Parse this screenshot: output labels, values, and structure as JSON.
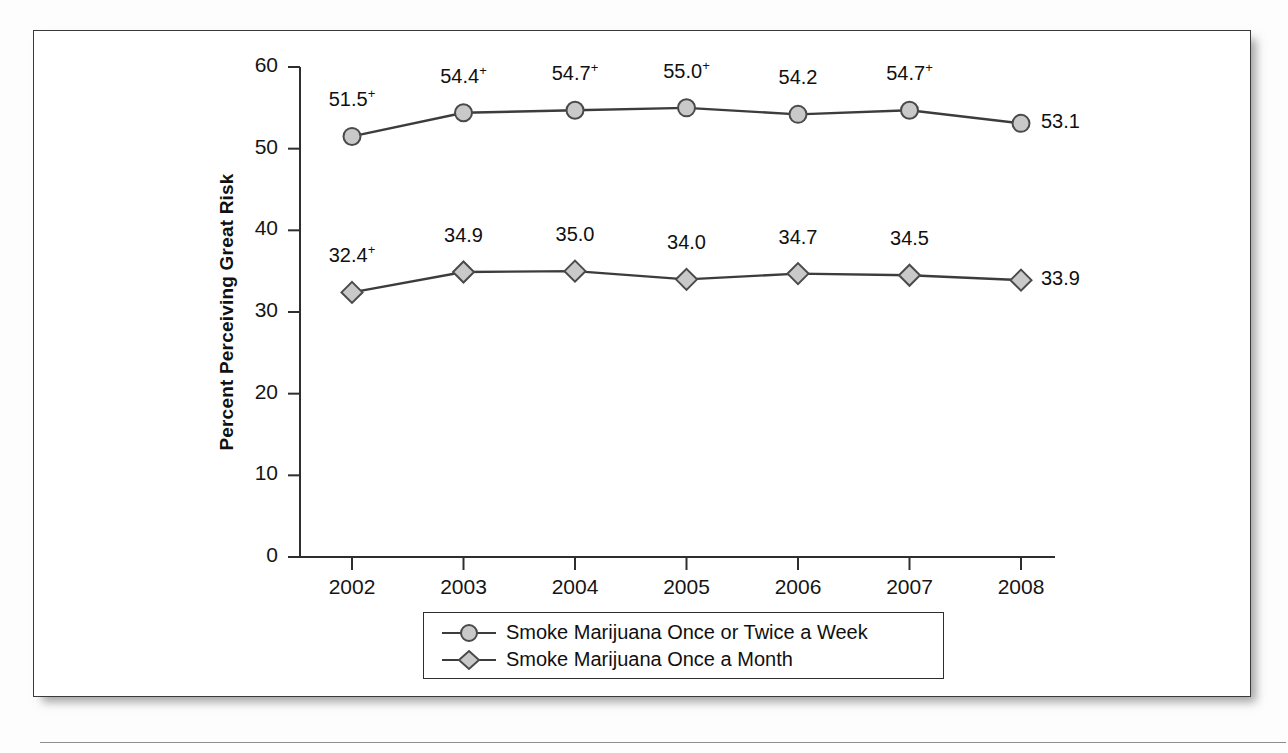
{
  "figure": {
    "y_axis_title": "Percent Perceiving Great Risk"
  },
  "chart_data": {
    "type": "line",
    "title": "",
    "subtitle": "",
    "xlabel": "",
    "ylabel": "Percent Perceiving Great Risk",
    "categories": [
      "2002",
      "2003",
      "2004",
      "2005",
      "2006",
      "2007",
      "2008"
    ],
    "x_tick_labels": [
      "2002",
      "2003",
      "2004",
      "2005",
      "2006",
      "2007",
      "2008"
    ],
    "y_tick_labels": [
      "0",
      "10",
      "20",
      "30",
      "40",
      "50",
      "60"
    ],
    "y_ticks": [
      0,
      10,
      20,
      30,
      40,
      50,
      60
    ],
    "ylim": [
      0,
      60
    ],
    "grid": false,
    "legend_position": "bottom-center",
    "annotation_note": "Superscript plus sign (+) marks values that differ significantly from the 2008 estimate.",
    "series": [
      {
        "name": "Smoke Marijuana Once or Twice a Week",
        "marker": "circle",
        "color": "#c9c9c9",
        "line_color": "#3c3c3c",
        "values": [
          51.5,
          54.4,
          54.7,
          55.0,
          54.2,
          54.7,
          53.1
        ],
        "labels": [
          "51.5",
          "54.4",
          "54.7",
          "55.0",
          "54.2",
          "54.7",
          "53.1"
        ],
        "significance": [
          true,
          true,
          true,
          true,
          false,
          true,
          false
        ],
        "label_positions": [
          "above",
          "above",
          "above",
          "above",
          "above",
          "above",
          "right"
        ]
      },
      {
        "name": "Smoke Marijuana Once a Month",
        "marker": "diamond",
        "color": "#c9c9c9",
        "line_color": "#3c3c3c",
        "values": [
          32.4,
          34.9,
          35.0,
          34.0,
          34.7,
          34.5,
          33.9
        ],
        "labels": [
          "32.4",
          "34.9",
          "35.0",
          "34.0",
          "34.7",
          "34.5",
          "33.9"
        ],
        "significance": [
          true,
          false,
          false,
          false,
          false,
          false,
          false
        ],
        "label_positions": [
          "above",
          "above",
          "above",
          "above",
          "above",
          "above",
          "right"
        ]
      }
    ]
  },
  "legend": {
    "items": [
      {
        "label": "Smoke Marijuana Once or Twice a Week",
        "marker": "circle"
      },
      {
        "label": "Smoke Marijuana Once a Month",
        "marker": "diamond"
      }
    ]
  }
}
